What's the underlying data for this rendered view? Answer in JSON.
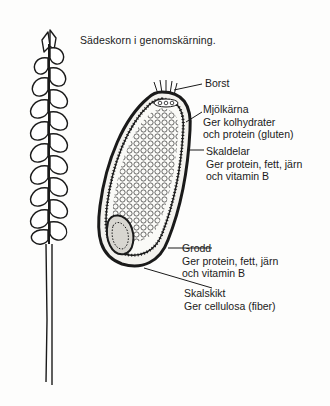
{
  "title": "Sädeskorn i genomskärning.",
  "labels": [
    {
      "id": "borst",
      "heading": "Borst",
      "lines": []
    },
    {
      "id": "mjolkarna",
      "heading": "Mjölkärna",
      "lines": [
        "Ger kolhydrater",
        "och protein (gluten)"
      ]
    },
    {
      "id": "skaldelar",
      "heading": "Skaldelar",
      "lines": [
        "Ger protein, fett, järn",
        "och vitamin B"
      ]
    },
    {
      "id": "grodd",
      "heading": "Grodd",
      "lines": [
        "Ger protein, fett, järn",
        "och vitamin B"
      ]
    },
    {
      "id": "skalskikt",
      "heading": "Skalskikt",
      "lines": [
        "Ger cellulosa (fiber)"
      ]
    }
  ],
  "illustrations": {
    "left": "wheat-ear-with-stalk",
    "center": "grain-kernel-cross-section"
  },
  "colors": {
    "ink": "#1a1a1a",
    "paper": "#fdfdfc"
  }
}
